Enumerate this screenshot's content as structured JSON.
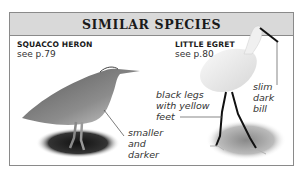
{
  "panel": {
    "title": "SIMILAR SPECIES"
  },
  "species": [
    {
      "name": "SQUACCO HERON",
      "page_ref": "see p.79",
      "annotation": "smaller\nand\ndarker"
    },
    {
      "name": "LITTLE EGRET",
      "page_ref": "see p.80",
      "annotations": [
        "black legs\nwith yellow\nfeet",
        "slim\ndark\nbill"
      ]
    }
  ]
}
